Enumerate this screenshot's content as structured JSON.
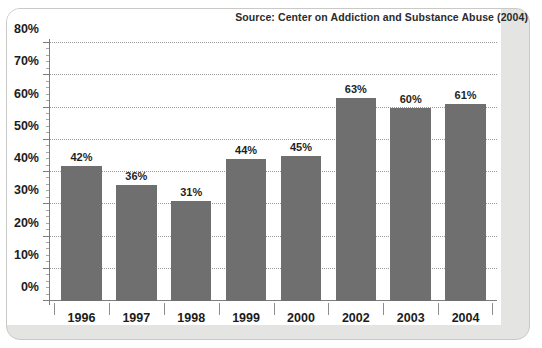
{
  "source_note": "Source: Center on Addiction and Substance Abuse (2004)",
  "chart_data": {
    "type": "bar",
    "title": "",
    "subtitle": "",
    "xlabel": "",
    "ylabel": "",
    "categories": [
      "1996",
      "1997",
      "1998",
      "1999",
      "2000",
      "2002",
      "2003",
      "2004"
    ],
    "values": [
      42,
      36,
      31,
      44,
      45,
      63,
      60,
      61
    ],
    "value_labels": [
      "42%",
      "36%",
      "31%",
      "44%",
      "45%",
      "63%",
      "60%",
      "61%"
    ],
    "ylim": [
      0,
      80
    ],
    "ytick_values": [
      0,
      10,
      20,
      30,
      40,
      50,
      60,
      70,
      80
    ],
    "ytick_labels": [
      "0%",
      "10%",
      "20%",
      "30%",
      "40%",
      "50%",
      "60%",
      "70%",
      "80%"
    ],
    "grid": true,
    "grid_style": "dotted",
    "legend": false,
    "legend_position": "none",
    "annotations": [
      "Source: Center on Addiction and Substance Abuse (2004)"
    ],
    "colors": {
      "bar": "#6f6f6f",
      "axis": "#7d7d7d",
      "grid": "#9a9a9a",
      "text": "#1c1c1c",
      "plot_background": "#ffffff",
      "card_background": "#e4e4e2",
      "card_border": "#c9c9c6"
    }
  }
}
